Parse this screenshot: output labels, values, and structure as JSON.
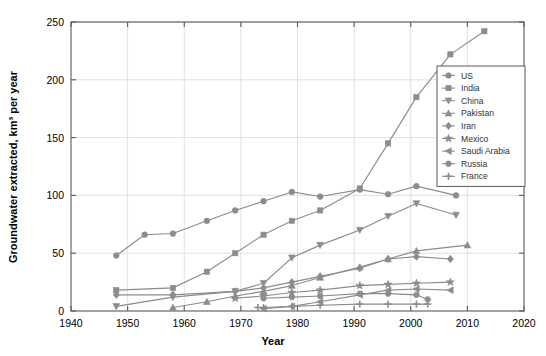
{
  "chart_data": {
    "type": "line",
    "title": "",
    "xlabel": "Year",
    "ylabel": "Groundwater extracted, km³ per year",
    "xlim": [
      1940,
      2020
    ],
    "ylim": [
      0,
      250
    ],
    "xticks": [
      1940,
      1950,
      1960,
      1970,
      1980,
      1990,
      2000,
      2010,
      2020
    ],
    "yticks": [
      0,
      50,
      100,
      150,
      200,
      250
    ],
    "grid": true,
    "legend_position": "right",
    "line_color": "#8c8c8c",
    "marker_color": "#8c8c8c",
    "series": [
      {
        "name": "US",
        "marker": "circle",
        "x": [
          1948,
          1953,
          1958,
          1964,
          1969,
          1974,
          1979,
          1984,
          1991,
          1996,
          2001,
          2008
        ],
        "y": [
          48,
          66,
          67,
          78,
          87,
          95,
          103,
          99,
          105,
          101,
          108,
          100
        ]
      },
      {
        "name": "India",
        "marker": "square",
        "x": [
          1948,
          1958,
          1964,
          1969,
          1974,
          1979,
          1984,
          1991,
          1996,
          2001,
          2007,
          2013
        ],
        "y": [
          18,
          20,
          34,
          50,
          66,
          78,
          87,
          106,
          145,
          185,
          222,
          242
        ]
      },
      {
        "name": "China",
        "marker": "triangle-down",
        "x": [
          1948,
          1958,
          1969,
          1974,
          1979,
          1984,
          1991,
          1996,
          2001,
          2008
        ],
        "y": [
          4,
          12,
          17,
          24,
          46,
          57,
          70,
          82,
          93,
          83
        ]
      },
      {
        "name": "Pakistan",
        "marker": "triangle-up",
        "x": [
          1958,
          1964,
          1969,
          1974,
          1979,
          1984,
          1991,
          1996,
          2001,
          2010
        ],
        "y": [
          3,
          8,
          13,
          17,
          22,
          29,
          38,
          45,
          52,
          57
        ]
      },
      {
        "name": "Iran",
        "marker": "diamond",
        "x": [
          1948,
          1958,
          1969,
          1974,
          1979,
          1984,
          1991,
          1996,
          2001,
          2007
        ],
        "y": [
          14,
          14,
          17,
          20,
          25,
          30,
          37,
          45,
          47,
          45
        ]
      },
      {
        "name": "Mexico",
        "marker": "star",
        "x": [
          1969,
          1974,
          1979,
          1984,
          1991,
          1996,
          2001,
          2007
        ],
        "y": [
          11,
          13,
          16,
          18,
          22,
          23,
          24,
          25
        ]
      },
      {
        "name": "Saudi Arabia",
        "marker": "triangle-left",
        "x": [
          1974,
          1979,
          1984,
          1991,
          1996,
          2001,
          2007
        ],
        "y": [
          2,
          4,
          8,
          14,
          18,
          19,
          18
        ]
      },
      {
        "name": "Russia",
        "marker": "hexagon",
        "x": [
          1974,
          1979,
          1984,
          1991,
          1996,
          2001,
          2003
        ],
        "y": [
          11,
          12,
          13,
          15,
          15,
          14,
          10
        ]
      },
      {
        "name": "France",
        "marker": "plus",
        "x": [
          1973,
          1974,
          1979,
          1984,
          1991,
          1996,
          2001,
          2003
        ],
        "y": [
          3,
          3,
          4,
          5,
          6,
          6,
          6,
          6
        ]
      }
    ]
  },
  "legend": {
    "entries": [
      {
        "label": "US"
      },
      {
        "label": "India"
      },
      {
        "label": "China"
      },
      {
        "label": "Pakistan"
      },
      {
        "label": "Iran"
      },
      {
        "label": "Mexico"
      },
      {
        "label": "Saudi Arabia"
      },
      {
        "label": "Russia"
      },
      {
        "label": "France"
      }
    ]
  },
  "axes": {
    "x_title": "Year",
    "y_title": "Groundwater extracted, km³ per year",
    "x_tick_labels": [
      "1940",
      "1950",
      "1960",
      "1970",
      "1980",
      "1990",
      "2000",
      "2010",
      "2020"
    ],
    "y_tick_labels": [
      "0",
      "50",
      "100",
      "150",
      "200",
      "250"
    ]
  }
}
